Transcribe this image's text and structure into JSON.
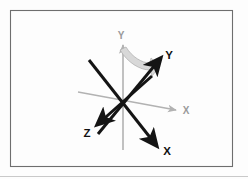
{
  "figure": {
    "kind": "coordinate-frame-rotation-diagram",
    "frame": {
      "border_color": "#6e6e6e",
      "fill_color": "#fdfdfd",
      "baseline_color": "#c9c9c9"
    },
    "colors": {
      "reference_axis": "#b2b2b2",
      "rotated_axis": "#141414",
      "rotation_arrow": "#d4d4d4",
      "rotation_arrow_edge": "#a8a8a8",
      "label_bold": "#111111",
      "label_gray": "#9a9a9a"
    },
    "origin": {
      "x": 123,
      "y": 101
    },
    "reference_axes": [
      {
        "name": "reference-x-axis",
        "label": "X",
        "label_x": 186,
        "label_y": 113,
        "from": {
          "x": 78,
          "y": 92
        },
        "to": {
          "x": 178,
          "y": 110
        },
        "arrowhead": true
      },
      {
        "name": "reference-y-axis",
        "label": "Y",
        "label_x": 120,
        "label_y": 40,
        "from": {
          "x": 123,
          "y": 150
        },
        "to": {
          "x": 123,
          "y": 42
        },
        "arrowhead": true
      }
    ],
    "rotated_axes": [
      {
        "name": "rotated-x-axis",
        "label": "X",
        "label_x": 164,
        "label_y": 157,
        "from": {
          "x": 89,
          "y": 60
        },
        "to": {
          "x": 158,
          "y": 147
        },
        "arrowhead": true
      },
      {
        "name": "rotated-y-axis",
        "label": "Y",
        "label_x": 168,
        "label_y": 60,
        "from": {
          "x": 98,
          "y": 134
        },
        "to": {
          "x": 162,
          "y": 57
        },
        "arrowhead": true
      },
      {
        "name": "rotated-z-axis",
        "label": "Z",
        "label_x": 87,
        "label_y": 136,
        "from": {
          "x": 152,
          "y": 76
        },
        "to": {
          "x": 96,
          "y": 126
        },
        "arrowhead": true
      }
    ],
    "rotation_arrow": {
      "name": "rotation-sweep-arrow",
      "description": "curved swept band from reference Y axis toward rotated Y axis",
      "start": {
        "x": 124,
        "y": 53
      },
      "end": {
        "x": 155,
        "y": 64
      }
    }
  }
}
